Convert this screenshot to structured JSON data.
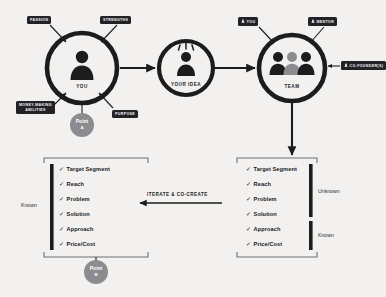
{
  "diagram": {
    "background_color": "#f2f1ef",
    "ink_color": "#1c1c1c",
    "accent_gray": "#8b8b90"
  },
  "nodes": [
    {
      "id": "you",
      "label": "YOU",
      "icon": "single-person-icon"
    },
    {
      "id": "your_idea",
      "label": "YOUR IDEA",
      "icon": "person-with-idea-icon"
    },
    {
      "id": "team",
      "label": "TEAM",
      "icon": "three-people-icon"
    }
  ],
  "you_tags": [
    {
      "id": "passion",
      "label": "PASSION"
    },
    {
      "id": "strengths",
      "label": "STRENGTHS"
    },
    {
      "id": "money_making_abilities",
      "label_line1": "MONEY-MAKING",
      "label_line2": "ABILITIES"
    },
    {
      "id": "purpose",
      "label": "PURPOSE"
    }
  ],
  "team_tags": [
    {
      "id": "team_you",
      "label": "YOU",
      "icon": "person-badge-icon"
    },
    {
      "id": "team_mentor",
      "label": "MENTOR",
      "icon": "person-badge-icon"
    },
    {
      "id": "team_cofounder",
      "label": "CO-FOUNDER(S)",
      "icon": "person-badge-icon"
    }
  ],
  "points": [
    {
      "id": "point_a",
      "title": "Point",
      "sub": "A"
    },
    {
      "id": "point_b",
      "title": "Point",
      "sub": "B"
    }
  ],
  "checklist_items": [
    "Target Segment",
    "Reach",
    "Problem",
    "Solution",
    "Approach",
    "Price/Cost"
  ],
  "tick_glyph": "✓",
  "left_panel": {
    "id": "left-checklist",
    "brackets": [
      {
        "id": "left-known",
        "label": "Known",
        "covers": [
          0,
          5
        ]
      }
    ]
  },
  "right_panel": {
    "id": "right-checklist",
    "brackets": [
      {
        "id": "right-unknown",
        "label": "Unknown",
        "covers": [
          0,
          3
        ]
      },
      {
        "id": "right-known",
        "label": "Known",
        "covers": [
          4,
          5
        ]
      }
    ]
  },
  "feedback_arrow": {
    "id": "iterate-arrow",
    "label": "ITERATE & CO-CREATE",
    "direction": "left"
  }
}
